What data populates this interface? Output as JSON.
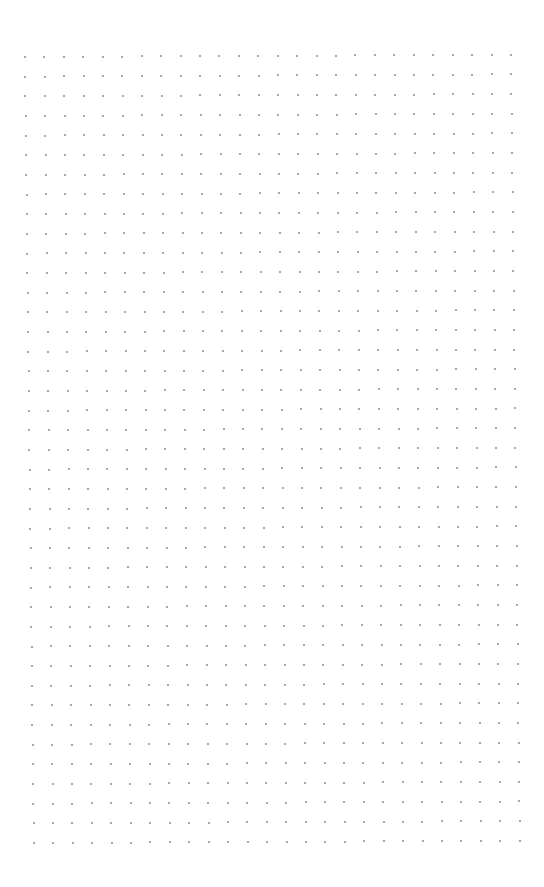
{
  "page": {
    "type": "dot-grid-paper",
    "background_color": "#ffffff"
  },
  "grid": {
    "columns": 26,
    "rows": 41,
    "dot_color": "#9a9a9a",
    "dot_size_px": 2,
    "origin": {
      "x": 25,
      "y": 57
    },
    "column_step": {
      "dx": 19.44,
      "dy": -0.09
    },
    "row_step": {
      "dx": 0.22,
      "dy": 19.65
    }
  }
}
